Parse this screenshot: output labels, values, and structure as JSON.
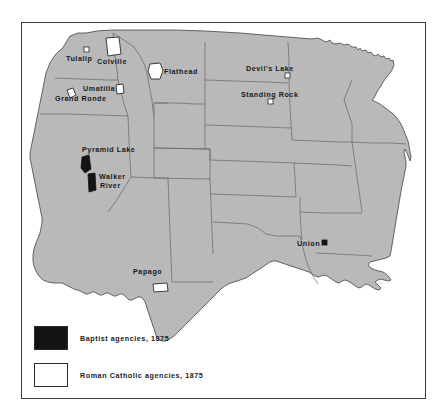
{
  "map": {
    "title": "Baptist and Roman Catholic Indian agencies, 1875",
    "region": "Western United States",
    "fill_color": "#b9b9b9",
    "outline_color": "#555555",
    "background_color": "#ffffff",
    "frame_color": "#3a3a3a",
    "agencies": [
      {
        "name": "Tulalip",
        "denomination": "Roman Catholic",
        "marker": "white-square",
        "state": "Washington"
      },
      {
        "name": "Colville",
        "denomination": "Roman Catholic",
        "marker": "white-polygon",
        "state": "Washington"
      },
      {
        "name": "Flathead",
        "denomination": "Roman Catholic",
        "marker": "white-polygon",
        "state": "Montana"
      },
      {
        "name": "Umatilla",
        "denomination": "Roman Catholic",
        "marker": "white-polygon",
        "state": "Oregon"
      },
      {
        "name": "Grand Ronde",
        "denomination": "Roman Catholic",
        "marker": "white-polygon",
        "state": "Oregon"
      },
      {
        "name": "Devil's Lake",
        "denomination": "Roman Catholic",
        "marker": "white-square",
        "state": "Dakota Territory"
      },
      {
        "name": "Standing Rock",
        "denomination": "Roman Catholic",
        "marker": "white-square",
        "state": "Dakota Territory"
      },
      {
        "name": "Pyramid Lake",
        "denomination": "Baptist",
        "marker": "black-polygon",
        "state": "Nevada"
      },
      {
        "name": "Walker River",
        "denomination": "Baptist",
        "marker": "black-polygon",
        "state": "Nevada"
      },
      {
        "name": "Papago",
        "denomination": "Roman Catholic",
        "marker": "white-rect",
        "state": "Arizona Territory"
      },
      {
        "name": "Union",
        "denomination": "Baptist",
        "marker": "black-square",
        "state": "Indian Territory"
      }
    ]
  },
  "legend": {
    "items": [
      {
        "label": "Baptist agencies, 1875",
        "color": "#141414",
        "swatch": "filled-black-square"
      },
      {
        "label": "Roman Catholic agencies, 1875",
        "color": "#ffffff",
        "swatch": "open-white-square"
      }
    ]
  },
  "labels": {
    "tulalip": "Tulalip",
    "colville": "Colville",
    "flathead": "Flathead",
    "umatilla": "Umatilla",
    "grand_ronde": "Grand Ronde",
    "devils_lake": "Devil's Lake",
    "standing_rock": "Standing Rock",
    "pyramid_lake": "Pyramid Lake",
    "walker_river_line1": "Walker",
    "walker_river_line2": "River",
    "papago": "Papago",
    "union": "Union"
  }
}
